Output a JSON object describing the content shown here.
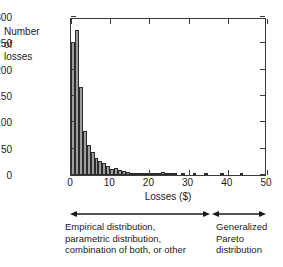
{
  "chart_data": {
    "type": "bar",
    "title": "",
    "subtitle": "",
    "xlabel": "Losses ($)",
    "ylabel": "Number of losses",
    "ylabel_lines": [
      "Number",
      "of",
      "losses"
    ],
    "xlim": [
      0,
      50
    ],
    "ylim": [
      0,
      300
    ],
    "xticks": [
      0,
      10,
      20,
      30,
      40,
      50
    ],
    "yticks": [
      0,
      50,
      100,
      150,
      200,
      250,
      300
    ],
    "grid": false,
    "legend": null,
    "bin_width": 1,
    "bar_color": "#9d9d9d",
    "bar_edge_color": "#2b2b2b",
    "x": [
      0.5,
      1.5,
      2.5,
      3.5,
      4.5,
      5.5,
      6.5,
      7.5,
      8.5,
      9.5,
      10.5,
      11.5,
      12.5,
      13.5,
      14.5,
      15.5,
      16.5,
      17.5,
      18.5,
      19.5,
      20.5,
      21.5,
      22.5,
      23.5,
      24.5,
      25.5,
      26.5,
      27.5,
      28.5,
      29.5,
      30.5,
      31.5,
      32.5,
      33.5,
      34.5,
      35.5,
      36.5,
      37.5,
      38.5,
      39.5,
      40.5,
      41.5,
      42.5,
      43.5,
      44.5,
      45.5,
      46.5,
      47.5,
      48.5,
      49.5
    ],
    "categories": [
      "0-1",
      "1-2",
      "2-3",
      "3-4",
      "4-5",
      "5-6",
      "6-7",
      "7-8",
      "8-9",
      "9-10",
      "10-11",
      "11-12",
      "12-13",
      "13-14",
      "14-15",
      "15-16",
      "16-17",
      "17-18",
      "18-19",
      "19-20",
      "20-21",
      "21-22",
      "22-23",
      "23-24",
      "24-25",
      "25-26",
      "26-27",
      "27-28",
      "28-29",
      "29-30",
      "30-31",
      "31-32",
      "32-33",
      "33-34",
      "34-35",
      "35-36",
      "36-37",
      "37-38",
      "38-39",
      "39-40",
      "40-41",
      "41-42",
      "42-43",
      "43-44",
      "44-45",
      "45-46",
      "46-47",
      "47-48",
      "48-49",
      "49-50"
    ],
    "values": [
      252,
      275,
      167,
      83,
      57,
      44,
      32,
      27,
      22,
      18,
      11,
      14,
      9,
      7,
      6,
      4,
      3,
      3,
      2,
      4,
      3,
      2,
      2,
      6,
      3,
      1,
      1,
      0,
      1,
      0,
      0,
      1,
      0,
      0,
      1,
      0,
      0,
      0,
      1,
      0,
      0,
      0,
      0,
      4,
      0,
      0,
      0,
      0,
      0,
      0
    ],
    "annotations": [
      {
        "id": "empirical-range",
        "text_lines": [
          "Empirical distribution,",
          "parametric distribution,",
          "combination of both, or other"
        ],
        "arrow": "double-headed",
        "x_start": 0,
        "x_end": 35
      },
      {
        "id": "gpd-range",
        "text_lines": [
          "Generalized",
          "Pareto",
          "distribution"
        ],
        "arrow": "double-headed",
        "x_start": 35,
        "x_end": 50
      }
    ]
  },
  "axes": {
    "y_title_lines": [
      "Number",
      "of",
      "losses"
    ],
    "x_title": "Losses ($)",
    "y_tick_labels": [
      "300",
      "250",
      "200",
      "150",
      "100",
      "50",
      "0"
    ],
    "x_tick_labels": [
      "0",
      "10",
      "20",
      "30",
      "40",
      "50"
    ]
  },
  "annotations": {
    "left": {
      "line1": "Empirical distribution,",
      "line2": "parametric distribution,",
      "line3": "combination of both, or other"
    },
    "right": {
      "line1": "Generalized",
      "line2": "Pareto",
      "line3": "distribution"
    }
  },
  "colors": {
    "bar_fill": "#9d9d9d",
    "bar_edge": "#2b2b2b",
    "axis": "#3a3a3a",
    "text": "#1a1a1a",
    "background": "#ffffff"
  }
}
